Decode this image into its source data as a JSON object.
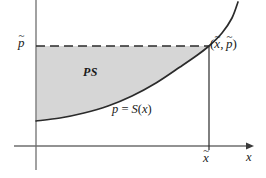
{
  "figure": {
    "name": "producer-surplus-diagram",
    "caption_region": "PS",
    "background_color": "#ffffff",
    "ink_color": "#2b2b2b",
    "shade_color": "#d6d6d6",
    "labels": {
      "price_level": "p",
      "price_level_accent": "~",
      "quantity_level": "x",
      "quantity_level_accent": "~",
      "region": "PS",
      "curve_lhs": "p",
      "curve_eq": "=",
      "curve_rhs_fn": "S",
      "curve_rhs_arg": "x",
      "point_open_paren": "(",
      "point_sep": ",",
      "point_close_paren": ")",
      "axis_x": "x"
    }
  },
  "chart_data": {
    "type": "line",
    "title": "",
    "xlabel": "x",
    "ylabel": "",
    "grid": false,
    "legend": false,
    "axes": {
      "x_axis_y_px": 146,
      "y_axis_x_px": 36,
      "x_axis_arrow": true,
      "y_axis_arrow": false
    },
    "series": [
      {
        "name": "p = S(x)",
        "label": "p = S(x)",
        "type": "supply-curve",
        "points_px": [
          [
            36,
            121
          ],
          [
            60,
            118
          ],
          [
            84,
            113
          ],
          [
            108,
            106
          ],
          [
            132,
            96
          ],
          [
            156,
            83
          ],
          [
            180,
            67
          ],
          [
            196,
            56
          ],
          [
            209,
            46
          ],
          [
            222,
            33
          ],
          [
            232,
            18
          ],
          [
            238,
            2
          ]
        ]
      }
    ],
    "annotations": [
      {
        "kind": "shaded-region",
        "label": "PS",
        "description": "producer surplus between p-tilde line and supply curve",
        "color": "#d6d6d6",
        "label_px": [
          88,
          72
        ]
      },
      {
        "kind": "dashed-horizontal",
        "from_px": [
          36,
          46
        ],
        "to_px": [
          209,
          46
        ],
        "label": "p-tilde"
      },
      {
        "kind": "solid-vertical",
        "from_px": [
          209,
          46
        ],
        "to_px": [
          209,
          146
        ],
        "label": "x-tilde"
      },
      {
        "kind": "equilibrium-point",
        "at_px": [
          209,
          46
        ],
        "label": "(x-tilde, p-tilde)"
      },
      {
        "kind": "tick",
        "axis": "x",
        "at_px": [
          209,
          146
        ],
        "label": "x-tilde"
      }
    ],
    "ticks": {
      "x": [
        "x-tilde"
      ],
      "y": [
        "p-tilde"
      ]
    }
  }
}
